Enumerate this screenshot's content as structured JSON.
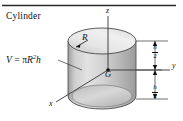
{
  "figure": {
    "title": "Cylinder",
    "formula": {
      "lhs": "V",
      "equals": "=",
      "pi": "π",
      "radius_symbol": "R",
      "exponent": "2",
      "height_symbol": "h",
      "full_text": "V = πR2h"
    },
    "axes": {
      "z_label": "z",
      "y_label": "y",
      "x_label": "x"
    },
    "annotations": {
      "radius_label": "R",
      "centroid_label": "G",
      "dimension_upper": {
        "numerator": "h",
        "denominator": "2"
      },
      "dimension_lower": {
        "numerator": "h",
        "denominator": "2"
      }
    },
    "colors": {
      "line": "#111111",
      "rule": "#2a2a2a",
      "body_light": "#e8e8e8",
      "body_mid": "#c9c9c9",
      "body_dark": "#a0a0a0",
      "top_face_light": "#f0f0f0",
      "top_face_dark": "#cfcfcf",
      "background": "#ffffff"
    }
  }
}
